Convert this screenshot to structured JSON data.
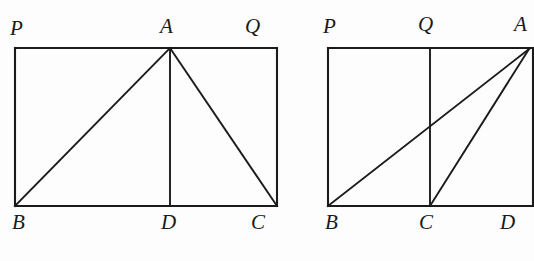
{
  "figure": {
    "background_color": "#fdfdfd",
    "stroke_color": "#1b1b1b",
    "label_color": "#1a1a1a",
    "panels": [
      {
        "id": "left-panel",
        "name": "triangle-in-rectangle-altitude",
        "rectangle": {
          "p": "P",
          "q": "Q",
          "c": "C",
          "b": "B"
        },
        "labels": [
          {
            "key": "P",
            "text": "P",
            "x": 10,
            "y": 18
          },
          {
            "key": "A",
            "text": "A",
            "x": 160,
            "y": 16
          },
          {
            "key": "Q",
            "text": "Q",
            "x": 245,
            "y": 16
          },
          {
            "key": "B",
            "text": "B",
            "x": 12,
            "y": 212
          },
          {
            "key": "D",
            "text": "D",
            "x": 161,
            "y": 212
          },
          {
            "key": "C",
            "text": "C",
            "x": 251,
            "y": 212
          }
        ],
        "points": {
          "P": {
            "x": 15,
            "y": 48
          },
          "A": {
            "x": 170,
            "y": 48
          },
          "Q": {
            "x": 277,
            "y": 48
          },
          "B": {
            "x": 15,
            "y": 206
          },
          "D": {
            "x": 170,
            "y": 206
          },
          "C": {
            "x": 277,
            "y": 206
          }
        },
        "segments": [
          {
            "name": "rect-top-PQ",
            "from": "P",
            "to": "Q"
          },
          {
            "name": "rect-left-PB",
            "from": "P",
            "to": "B"
          },
          {
            "name": "rect-bottom-BC",
            "from": "B",
            "to": "C"
          },
          {
            "name": "rect-right-QC",
            "from": "Q",
            "to": "C"
          },
          {
            "name": "triangle-side-BA",
            "from": "B",
            "to": "A"
          },
          {
            "name": "triangle-side-AC",
            "from": "A",
            "to": "C"
          },
          {
            "name": "altitude-AD",
            "from": "A",
            "to": "D"
          }
        ]
      },
      {
        "id": "right-panel",
        "name": "triangle-in-rectangle-oblique",
        "rectangle": {
          "p": "P",
          "q": "Q",
          "c": "C",
          "b": "B"
        },
        "labels": [
          {
            "key": "P",
            "text": "P",
            "x": 323,
            "y": 16
          },
          {
            "key": "Q",
            "text": "Q",
            "x": 418,
            "y": 14
          },
          {
            "key": "A",
            "text": "A",
            "x": 514,
            "y": 14
          },
          {
            "key": "B",
            "text": "B",
            "x": 325,
            "y": 212
          },
          {
            "key": "C",
            "text": "C",
            "x": 419,
            "y": 212
          },
          {
            "key": "D",
            "text": "D",
            "x": 500,
            "y": 212
          }
        ],
        "points": {
          "P": {
            "x": 328,
            "y": 48
          },
          "Q": {
            "x": 430,
            "y": 48
          },
          "A": {
            "x": 529,
            "y": 48
          },
          "B": {
            "x": 328,
            "y": 206
          },
          "C": {
            "x": 430,
            "y": 206
          },
          "D": {
            "x": 534,
            "y": 206
          }
        },
        "segments": [
          {
            "name": "rect-top-PA",
            "from": "P",
            "to": "A"
          },
          {
            "name": "rect-left-PB",
            "from": "P",
            "to": "B"
          },
          {
            "name": "rect-bottom-BD",
            "from": "B",
            "to": "D"
          },
          {
            "name": "rect-right-AD",
            "from": "A",
            "to": "D"
          },
          {
            "name": "vertical-QC",
            "from": "Q",
            "to": "C"
          },
          {
            "name": "triangle-side-BA",
            "from": "B",
            "to": "A"
          },
          {
            "name": "triangle-side-CA",
            "from": "C",
            "to": "A"
          }
        ]
      }
    ]
  }
}
